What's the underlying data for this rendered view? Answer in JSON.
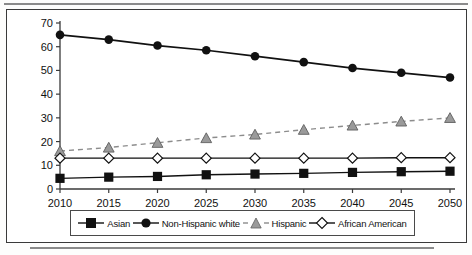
{
  "chart_data": {
    "type": "line",
    "title": "",
    "subtitle": "",
    "xlabel": "",
    "ylabel": "",
    "categories": [
      "2010",
      "2015",
      "2020",
      "2025",
      "2030",
      "2035",
      "2040",
      "2045",
      "2050"
    ],
    "x_ticks": [
      "2010",
      "2015",
      "2020",
      "2025",
      "2030",
      "2035",
      "2040",
      "2045",
      "2050"
    ],
    "y_ticks": [
      "0",
      "10",
      "20",
      "30",
      "40",
      "50",
      "60",
      "70"
    ],
    "ylim": [
      0,
      70
    ],
    "xlim": [
      2010,
      2050
    ],
    "grid": false,
    "legend_position": "bottom",
    "series": [
      {
        "name": "Asian",
        "marker": "filled-square",
        "line_style": "solid",
        "color": "#111111",
        "values": [
          4.5,
          5.0,
          5.3,
          6.0,
          6.3,
          6.6,
          7.0,
          7.3,
          7.5
        ]
      },
      {
        "name": "Non-Hispanic white",
        "marker": "filled-circle",
        "line_style": "solid",
        "color": "#111111",
        "values": [
          65.0,
          63.0,
          60.5,
          58.5,
          56.0,
          53.5,
          51.0,
          49.0,
          47.0
        ]
      },
      {
        "name": "Hispanic",
        "marker": "filled-triangle",
        "line_style": "dashed",
        "color": "#8c8c8c",
        "values": [
          16.0,
          17.5,
          19.5,
          21.5,
          23.0,
          25.0,
          26.8,
          28.5,
          30.0
        ]
      },
      {
        "name": "African American",
        "marker": "open-diamond",
        "line_style": "solid",
        "color": "#111111",
        "values": [
          13.0,
          13.0,
          13.0,
          13.0,
          13.0,
          13.0,
          13.0,
          13.2,
          13.2
        ]
      }
    ]
  },
  "legend": {
    "items": [
      {
        "label": "Asian",
        "icon": "filled-square-marker-icon"
      },
      {
        "label": "Non-Hispanic white",
        "icon": "filled-circle-marker-icon"
      },
      {
        "label": "Hispanic",
        "icon": "filled-triangle-marker-icon"
      },
      {
        "label": "African American",
        "icon": "open-diamond-marker-icon"
      }
    ]
  },
  "colors": {
    "axis": "#3a3a3a",
    "frame": "#3a3a3a",
    "gray_series": "#8c8c8c",
    "dark_series": "#111111",
    "rule": "#8a8a8a"
  }
}
